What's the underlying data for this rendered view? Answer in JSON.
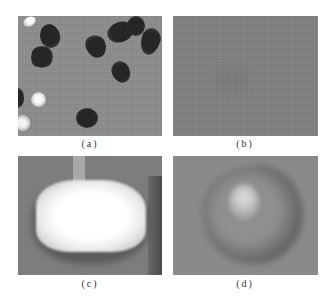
{
  "figure": {
    "panels": [
      {
        "id": "a",
        "caption": "(a)",
        "description": "seeds image: dark seeds and bright spots on gray background"
      },
      {
        "id": "b",
        "caption": "(b)",
        "description": "uniform gray background texture"
      },
      {
        "id": "c",
        "caption": "(c)",
        "description": "zoomed bright blob with pixelated edges"
      },
      {
        "id": "d",
        "caption": "(d)",
        "description": "zoomed dark seed with bright highlight"
      }
    ],
    "colors": {
      "background": "#ffffff",
      "panel_a_bg": "#8e8e8e",
      "panel_b_bg": "#828282",
      "panel_c_bg": "#7d7d7d",
      "panel_d_bg": "#8a8a8a",
      "seed_dark": "#2a2a2a",
      "highlight": "#f4f4f4"
    }
  }
}
